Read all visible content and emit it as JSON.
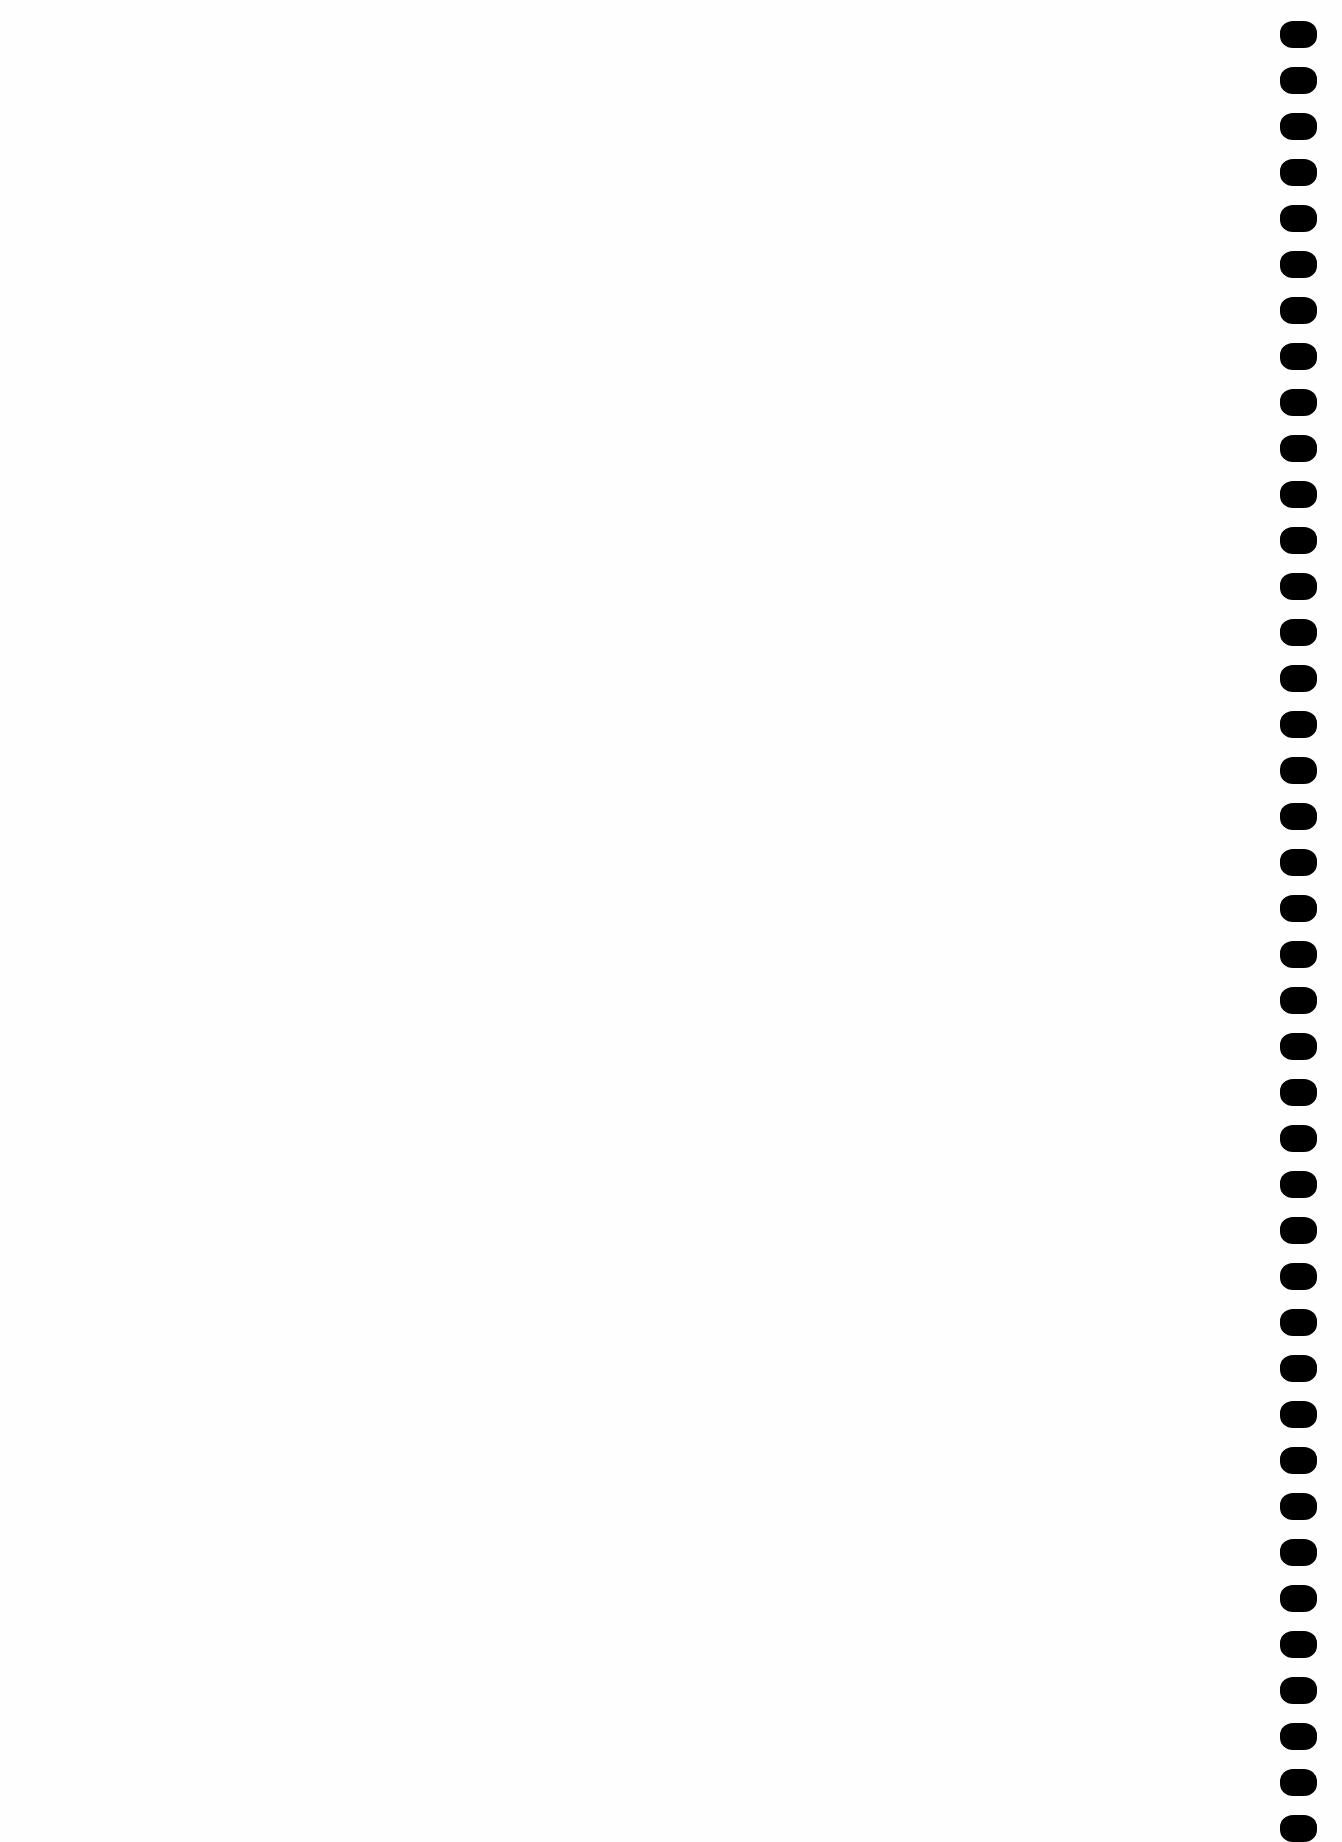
{
  "page": {
    "background": "#fefefe",
    "content_text": ""
  },
  "binding_holes": {
    "count": 40,
    "color": "#000000",
    "first_top_px": 21,
    "spacing_px": 46
  }
}
